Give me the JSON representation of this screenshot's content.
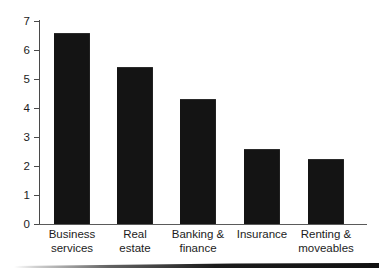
{
  "chart_data": {
    "type": "bar",
    "title": "",
    "subtitle": "",
    "xlabel": "",
    "ylabel": "",
    "categories": [
      "Business\nservices",
      "Real\nestate",
      "Banking &\nfinance",
      "Insurance",
      "Renting &\nmoveables"
    ],
    "values": [
      6.6,
      5.4,
      4.3,
      2.6,
      2.25
    ],
    "ylim": [
      0,
      7
    ],
    "yticks": [
      0,
      1,
      2,
      3,
      4,
      5,
      6,
      7
    ],
    "ytick_labels": [
      "0",
      "1",
      "2",
      "3",
      "4",
      "5",
      "6",
      "7"
    ],
    "grid": false,
    "legend": null,
    "bar_color": "#141414",
    "axis_color": "#4a4a4a",
    "background_color": "#ffffff"
  },
  "axis": {
    "y_ticks": [
      {
        "label": "7",
        "value": 7
      },
      {
        "label": "6",
        "value": 6
      },
      {
        "label": "5",
        "value": 5
      },
      {
        "label": "4",
        "value": 4
      },
      {
        "label": "3",
        "value": 3
      },
      {
        "label": "2",
        "value": 2
      },
      {
        "label": "1",
        "value": 1
      },
      {
        "label": "0",
        "value": 0
      }
    ]
  },
  "bars": [
    {
      "label": "Business\nservices",
      "value": 6.6
    },
    {
      "label": "Real\nestate",
      "value": 5.4
    },
    {
      "label": "Banking &\nfinance",
      "value": 4.3
    },
    {
      "label": "Insurance",
      "value": 2.6
    },
    {
      "label": "Renting &\nmoveables",
      "value": 2.25
    }
  ]
}
